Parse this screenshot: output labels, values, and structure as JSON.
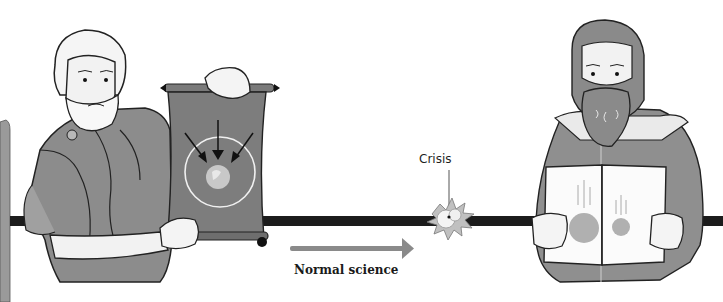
{
  "diagram": {
    "labels": {
      "crisis": "Crisis",
      "normal_science": "Normal science"
    },
    "figures": [
      {
        "id": "left-figure",
        "description": "Bearded ancient philosopher in toga holding a scroll",
        "holds": "scroll",
        "scroll_content": "Earth at center of circle with three arrows pointing inward"
      },
      {
        "id": "right-figure",
        "description": "Bearded scholar in jacket holding an open book",
        "holds": "book",
        "book_content": "Large and small sphere falling side by side"
      }
    ],
    "timeline": {
      "arrow_direction": "right",
      "events": [
        "Normal science",
        "Crisis"
      ]
    },
    "colors": {
      "background": "#ffffff",
      "timeline_bar": "#1c1c1c",
      "arrow": "#8a8a8a",
      "robe": "#8c8c8c",
      "scroll": "#7d7d7d",
      "skin": "#f2f2f2",
      "left_pillar": "#9a9a9a",
      "sphere": "#b0b0b0"
    }
  }
}
